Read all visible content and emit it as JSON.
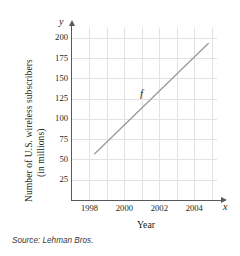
{
  "chart_data": {
    "type": "line",
    "title": "",
    "xlabel": "Year",
    "ylabel_line1": "Number of U.S. wireless subscribers",
    "ylabel_line2": "(in millions)",
    "x_axis_variable": "y",
    "y_axis_variable": "x",
    "xlim": [
      1997,
      2005.3
    ],
    "ylim": [
      0,
      212
    ],
    "xticks": [
      1998,
      2000,
      2002,
      2004
    ],
    "xtick_labels": [
      "1998",
      "2000",
      "2002",
      "2004"
    ],
    "yticks": [
      25,
      50,
      75,
      100,
      125,
      150,
      175,
      200
    ],
    "ytick_labels": [
      "25",
      "50",
      "75",
      "100",
      "125",
      "150",
      "175",
      "200"
    ],
    "grid": true,
    "grid_x_values": [
      1998,
      1999,
      2000,
      2001,
      2002,
      2003,
      2004,
      2005
    ],
    "grid_y_values": [
      25,
      50,
      75,
      100,
      125,
      150,
      175,
      200
    ],
    "legend": "none",
    "series": [
      {
        "name": "f",
        "annotation": "f",
        "x": [
          1998.3,
          2004.8
        ],
        "values": [
          57,
          193
        ],
        "color": "#9a9a9e"
      }
    ],
    "source_note": "Source: Lehman Bros."
  },
  "figure": {
    "source": "Source: Lehman Bros.",
    "f_label": "f",
    "x_var": "x",
    "y_var": "y"
  }
}
